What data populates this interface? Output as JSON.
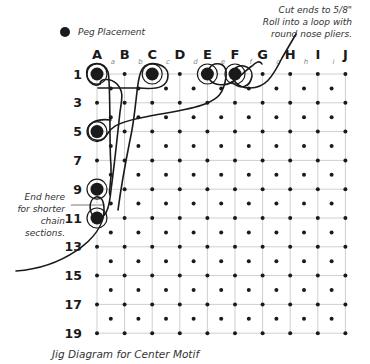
{
  "legend": {
    "label": "Peg Placement",
    "icon": "filled-circle"
  },
  "annotations": {
    "top_right": [
      "Cut ends to 5/8\"",
      "Roll into a loop with",
      "round nose pliers."
    ],
    "left": [
      "End here",
      "for shorter",
      "chain",
      "sections."
    ]
  },
  "caption": "Jig Diagram for Center Motif",
  "grid": {
    "columns": [
      "A",
      "B",
      "C",
      "D",
      "E",
      "F",
      "G",
      "H",
      "I",
      "J"
    ],
    "sub_columns": [
      "a",
      "b",
      "c",
      "d",
      "e",
      "f",
      "g",
      "h",
      "i"
    ],
    "row_labels": [
      "1",
      "3",
      "5",
      "7",
      "9",
      "11",
      "13",
      "15",
      "17",
      "19"
    ],
    "row_count": 19
  },
  "pegs": [
    {
      "col": "A",
      "row": 1
    },
    {
      "col": "C",
      "row": 1
    },
    {
      "col": "E",
      "row": 1
    },
    {
      "col": "F",
      "row": 1
    },
    {
      "col": "A",
      "row": 5
    },
    {
      "col": "A",
      "row": 9
    },
    {
      "col": "A",
      "row": 11
    }
  ],
  "colors": {
    "ink": "#1a1a1a",
    "grid": "#cfcfcf",
    "sublabel": "#888888"
  }
}
